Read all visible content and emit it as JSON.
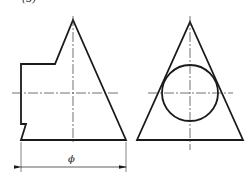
{
  "figure": {
    "label": "(5)",
    "dimension_label": "ϕ",
    "colors": {
      "outline": "#1a1a1a",
      "centerline": "#333333",
      "background": "#ffffff"
    },
    "front_view": {
      "outline_points": [
        [
          21,
          64
        ],
        [
          55,
          64
        ],
        [
          73,
          20
        ],
        [
          126,
          140
        ],
        [
          21,
          140
        ],
        [
          26,
          124
        ],
        [
          21,
          124
        ]
      ],
      "horizontal_centerline": {
        "x1": 12,
        "x2": 118,
        "y": 93
      },
      "vertical_centerline": {
        "x": 73,
        "y1": 16,
        "y2": 144
      },
      "dimension": {
        "y": 167,
        "x1": 21,
        "x2": 126,
        "ext_y1": 142,
        "ext_y2": 172
      }
    },
    "side_view": {
      "triangle_points": [
        [
          190,
          22
        ],
        [
          243,
          140
        ],
        [
          137,
          140
        ]
      ],
      "circle": {
        "cx": 190,
        "cy": 93,
        "r": 28
      },
      "horizontal_centerline": {
        "x1": 148,
        "x2": 233,
        "y": 93
      },
      "vertical_centerline": {
        "x": 190,
        "y1": 16,
        "y2": 150
      }
    }
  }
}
